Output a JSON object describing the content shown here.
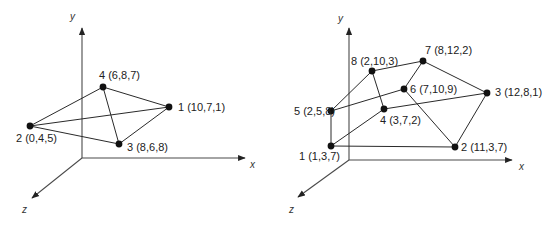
{
  "colors": {
    "line": "#2a2a2a",
    "axis": "#4a4a4a",
    "vertex": "#111111",
    "background": "#ffffff"
  },
  "diagrams": [
    {
      "name": "tetrahedron",
      "axes": {
        "origin": [
          82,
          158
        ],
        "y": {
          "label": "y",
          "tip": [
            82,
            28
          ],
          "label_pos": [
            70,
            20
          ]
        },
        "x": {
          "label": "x",
          "tip": [
            245,
            158
          ],
          "label_pos": [
            250,
            168
          ]
        },
        "z": {
          "label": "z",
          "tip": [
            32,
            198
          ],
          "label_pos": [
            22,
            213
          ]
        }
      },
      "vertices": [
        {
          "id": "1",
          "label": "1 (10,7,1)",
          "coords": [
            10,
            7,
            1
          ],
          "pos": [
            169,
            107
          ],
          "label_pos": [
            178,
            111
          ],
          "anchor": "start"
        },
        {
          "id": "2",
          "label": "2 (0,4,5)",
          "coords": [
            0,
            4,
            5
          ],
          "pos": [
            30,
            126
          ],
          "label_pos": [
            16,
            142
          ],
          "anchor": "start"
        },
        {
          "id": "3",
          "label": "3 (8,6,8)",
          "coords": [
            8,
            6,
            8
          ],
          "pos": [
            119,
            144
          ],
          "label_pos": [
            127,
            151
          ],
          "anchor": "start"
        },
        {
          "id": "4",
          "label": "4 (6,8,7)",
          "coords": [
            6,
            8,
            7
          ],
          "pos": [
            103,
            87
          ],
          "label_pos": [
            99,
            79
          ],
          "anchor": "start"
        }
      ],
      "edges": [
        [
          "2",
          "4"
        ],
        [
          "4",
          "1"
        ],
        [
          "2",
          "1"
        ],
        [
          "2",
          "3"
        ],
        [
          "4",
          "3"
        ],
        [
          "3",
          "1"
        ]
      ]
    },
    {
      "name": "octahedron-like-solid",
      "axes": {
        "origin": [
          349,
          160
        ],
        "y": {
          "label": "y",
          "tip": [
            349,
            28
          ],
          "label_pos": [
            338,
            22
          ]
        },
        "x": {
          "label": "x",
          "tip": [
            512,
            160
          ],
          "label_pos": [
            519,
            170
          ]
        },
        "z": {
          "label": "z",
          "tip": [
            298,
            197
          ],
          "label_pos": [
            289,
            213
          ]
        }
      },
      "vertices": [
        {
          "id": "1",
          "label": "1 (1,3,7)",
          "coords": [
            1,
            3,
            7
          ],
          "pos": [
            331,
            146
          ],
          "label_pos": [
            299,
            160
          ],
          "anchor": "start"
        },
        {
          "id": "2",
          "label": "2 (11,3,7)",
          "coords": [
            11,
            3,
            7
          ],
          "pos": [
            455,
            147
          ],
          "label_pos": [
            461,
            151
          ],
          "anchor": "start"
        },
        {
          "id": "3",
          "label": "3 (12,8,1)",
          "coords": [
            12,
            8,
            1
          ],
          "pos": [
            487,
            93
          ],
          "label_pos": [
            495,
            96
          ],
          "anchor": "start"
        },
        {
          "id": "4",
          "label": "4 (3,7,2)",
          "coords": [
            3,
            7,
            2
          ],
          "pos": [
            384,
            109
          ],
          "label_pos": [
            380,
            124
          ],
          "anchor": "start"
        },
        {
          "id": "5",
          "label": "5 (2,5,8)",
          "coords": [
            2,
            5,
            8
          ],
          "pos": [
            331,
            111
          ],
          "label_pos": [
            294,
            115
          ],
          "anchor": "start"
        },
        {
          "id": "6",
          "label": "6 (7,10,9)",
          "coords": [
            7,
            10,
            9
          ],
          "pos": [
            404,
            89
          ],
          "label_pos": [
            410,
            93
          ],
          "anchor": "start"
        },
        {
          "id": "7",
          "label": "7 (8,12,2)",
          "coords": [
            8,
            12,
            2
          ],
          "pos": [
            423,
            61
          ],
          "label_pos": [
            425,
            54
          ],
          "anchor": "start"
        },
        {
          "id": "8",
          "label": "8 (2,10,3)",
          "coords": [
            2,
            10,
            3
          ],
          "pos": [
            372,
            71
          ],
          "label_pos": [
            351,
            65
          ],
          "anchor": "start"
        }
      ],
      "edges": [
        [
          "1",
          "2"
        ],
        [
          "1",
          "5"
        ],
        [
          "1",
          "4"
        ],
        [
          "5",
          "8"
        ],
        [
          "5",
          "6"
        ],
        [
          "8",
          "7"
        ],
        [
          "8",
          "4"
        ],
        [
          "7",
          "3"
        ],
        [
          "7",
          "6"
        ],
        [
          "6",
          "2"
        ],
        [
          "4",
          "3"
        ],
        [
          "3",
          "2"
        ]
      ]
    }
  ]
}
